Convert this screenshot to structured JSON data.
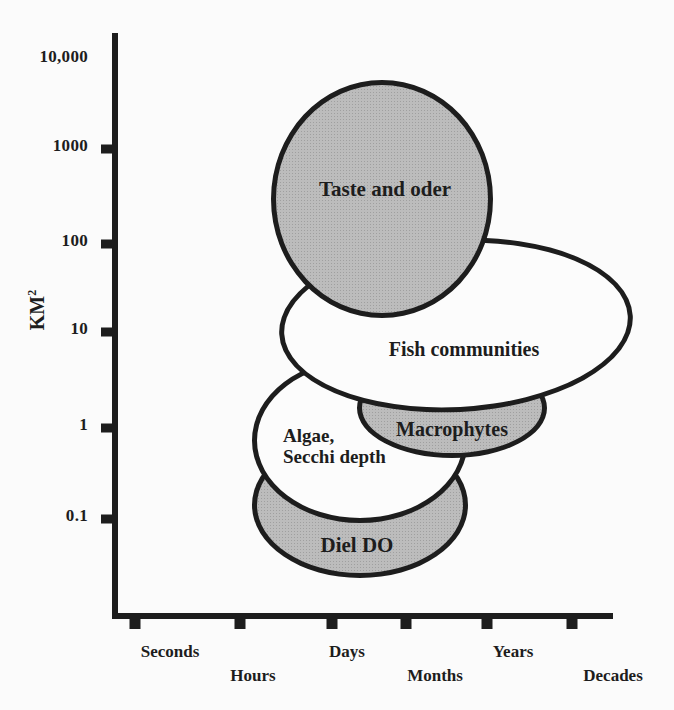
{
  "colors": {
    "background": "#fbfbfb",
    "ink": "#1d1d1d",
    "gray_fill": "#bcbcbc",
    "halftone_dot": "#9f9f9f",
    "white_fill": "#fcfcfc"
  },
  "y_axis": {
    "label_base": "KM",
    "label_sup": "2",
    "ticks": [
      {
        "label": "10,000",
        "y": 57,
        "tick": false
      },
      {
        "label": "1000",
        "y": 146,
        "tick": true
      },
      {
        "label": "100",
        "y": 241,
        "tick": true
      },
      {
        "label": "10",
        "y": 329,
        "tick": true
      },
      {
        "label": "1",
        "y": 425,
        "tick": true
      },
      {
        "label": "0.1",
        "y": 516,
        "tick": true
      }
    ]
  },
  "x_axis": {
    "tick_xs": [
      135,
      240,
      332,
      406,
      487,
      572
    ],
    "labels": [
      {
        "text": "Seconds",
        "x": 170,
        "y": 652
      },
      {
        "text": "Hours",
        "x": 253,
        "y": 676
      },
      {
        "text": "Days",
        "x": 347,
        "y": 652
      },
      {
        "text": "Months",
        "x": 435,
        "y": 676
      },
      {
        "text": "Years",
        "x": 513,
        "y": 652
      },
      {
        "text": "Decades",
        "x": 613,
        "y": 676
      }
    ]
  },
  "chart_data": {
    "type": "scatter",
    "subtype": "overlapping-ellipse-regions",
    "title": "",
    "xlabel": "time scale (log)",
    "ylabel": "KM²",
    "y_scale": "log",
    "x_tick_labels": [
      "Seconds",
      "Hours",
      "Days",
      "Months",
      "Years",
      "Decades"
    ],
    "y_tick_labels": [
      "10,000",
      "1000",
      "100",
      "10",
      "1",
      "0.1"
    ],
    "regions": [
      {
        "id": "diel-do",
        "label_lines": [
          "Diel DO"
        ],
        "fill": "gray",
        "time_range": [
          "Hours",
          "Years"
        ],
        "area_km2_range": [
          0.02,
          0.8
        ],
        "px": {
          "left": 252,
          "top": 432,
          "width": 216,
          "height": 146,
          "rotate": 0
        },
        "label_px": {
          "x": 357,
          "y": 546,
          "size": 21,
          "align": "center"
        }
      },
      {
        "id": "algae-secchi-depth",
        "label_lines": [
          "Algae,",
          "Secchi depth"
        ],
        "fill": "white",
        "time_range": [
          "Hours",
          "Years"
        ],
        "area_km2_range": [
          0.08,
          5
        ],
        "px": {
          "left": 252,
          "top": 358,
          "width": 216,
          "height": 165,
          "rotate": 0
        },
        "label_px": {
          "x": 283,
          "y": 446,
          "size": 19,
          "align": "left"
        }
      },
      {
        "id": "macrophytes",
        "label_lines": [
          "Macrophytes"
        ],
        "fill": "gray",
        "time_range": [
          "Days",
          "Years"
        ],
        "area_km2_range": [
          0.4,
          5
        ],
        "px": {
          "left": 357,
          "top": 358,
          "width": 190,
          "height": 100,
          "rotate": 0
        },
        "label_px": {
          "x": 452,
          "y": 429,
          "size": 20,
          "align": "center"
        }
      },
      {
        "id": "fish-communities",
        "label_lines": [
          "Fish communities"
        ],
        "fill": "white",
        "time_range": [
          "Hours",
          "Decades"
        ],
        "area_km2_range": [
          1.3,
          100
        ],
        "px": {
          "left": 279,
          "top": 238,
          "width": 354,
          "height": 174,
          "rotate": -3
        },
        "label_px": {
          "x": 464,
          "y": 349,
          "size": 20,
          "align": "center"
        }
      },
      {
        "id": "taste-and-oder",
        "label_lines": [
          "Taste and oder"
        ],
        "fill": "gray",
        "time_range": [
          "Hours",
          "Years"
        ],
        "area_km2_range": [
          13,
          5400
        ],
        "px": {
          "left": 271,
          "top": 80,
          "width": 222,
          "height": 238,
          "rotate": 0
        },
        "label_px": {
          "x": 385,
          "y": 190,
          "size": 21,
          "align": "center"
        }
      }
    ]
  }
}
